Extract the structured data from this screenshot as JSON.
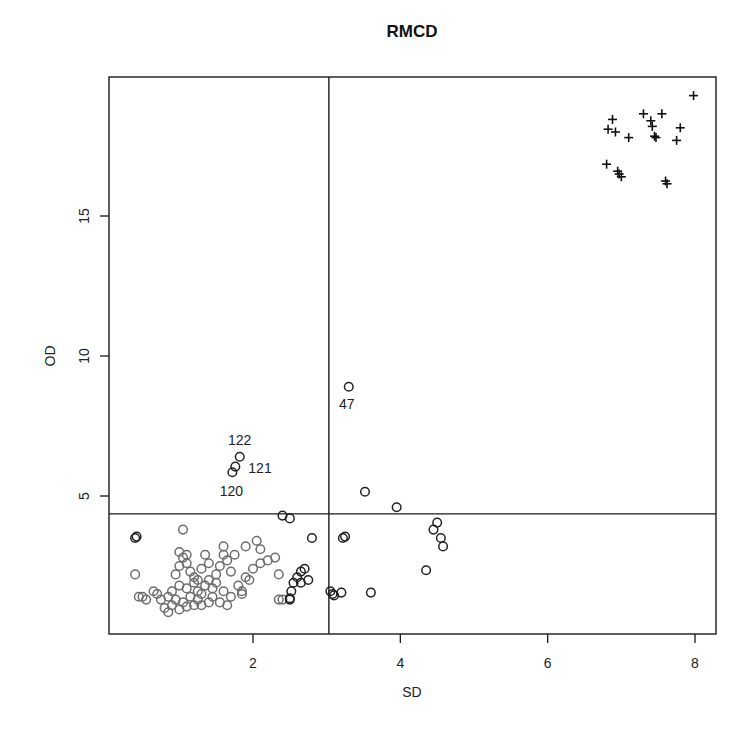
{
  "chart_data": {
    "type": "scatter",
    "title": "RMCD",
    "xlabel": "SD",
    "ylabel": "OD",
    "xlim": [
      0.2,
      8.3
    ],
    "ylim": [
      0.0,
      19.9
    ],
    "x_ticks": [
      2,
      4,
      6,
      8
    ],
    "y_ticks": [
      5,
      10,
      15
    ],
    "grid": false,
    "legend": null,
    "cutoffs": {
      "sd": 3.03,
      "od": 4.36
    },
    "series": [
      {
        "name": "regular (gray circles)",
        "marker": "circle",
        "color": "#6e6e6e",
        "points": [
          [
            0.8,
            1.0
          ],
          [
            0.85,
            0.85
          ],
          [
            0.9,
            1.1
          ],
          [
            0.95,
            1.3
          ],
          [
            1.0,
            0.95
          ],
          [
            1.05,
            1.2
          ],
          [
            1.1,
            1.05
          ],
          [
            1.15,
            1.4
          ],
          [
            1.2,
            1.1
          ],
          [
            1.25,
            1.6
          ],
          [
            0.7,
            1.5
          ],
          [
            0.75,
            1.3
          ],
          [
            0.9,
            1.6
          ],
          [
            1.0,
            1.8
          ],
          [
            1.1,
            1.7
          ],
          [
            1.2,
            1.9
          ],
          [
            1.3,
            1.5
          ],
          [
            1.35,
            1.8
          ],
          [
            1.4,
            2.0
          ],
          [
            1.45,
            1.7
          ],
          [
            0.95,
            2.2
          ],
          [
            1.0,
            2.5
          ],
          [
            1.05,
            2.8
          ],
          [
            1.1,
            2.6
          ],
          [
            1.15,
            2.3
          ],
          [
            1.2,
            2.1
          ],
          [
            1.3,
            2.4
          ],
          [
            1.4,
            2.6
          ],
          [
            1.5,
            2.2
          ],
          [
            1.55,
            2.5
          ],
          [
            1.6,
            2.9
          ],
          [
            1.65,
            2.7
          ],
          [
            1.7,
            2.3
          ],
          [
            1.5,
            1.9
          ],
          [
            1.6,
            1.6
          ],
          [
            1.7,
            1.4
          ],
          [
            1.55,
            1.2
          ],
          [
            1.65,
            1.1
          ],
          [
            1.8,
            1.8
          ],
          [
            1.85,
            1.6
          ],
          [
            1.9,
            2.1
          ],
          [
            2.0,
            2.4
          ],
          [
            2.1,
            2.6
          ],
          [
            2.2,
            2.7
          ],
          [
            2.3,
            2.8
          ],
          [
            1.6,
            3.2
          ],
          [
            1.75,
            2.9
          ],
          [
            1.35,
            2.9
          ],
          [
            1.0,
            3.0
          ],
          [
            1.1,
            2.9
          ],
          [
            0.4,
            2.2
          ],
          [
            0.5,
            1.4
          ],
          [
            0.55,
            1.3
          ],
          [
            0.45,
            1.4
          ],
          [
            1.3,
            1.1
          ],
          [
            1.4,
            1.2
          ],
          [
            1.45,
            1.4
          ],
          [
            1.25,
            1.3
          ],
          [
            2.35,
            2.2
          ],
          [
            2.35,
            1.3
          ],
          [
            2.05,
            3.4
          ],
          [
            2.1,
            3.1
          ],
          [
            1.9,
            3.2
          ],
          [
            1.05,
            3.8
          ],
          [
            1.25,
            2.0
          ],
          [
            0.85,
            1.4
          ],
          [
            0.65,
            1.6
          ],
          [
            1.85,
            1.5
          ],
          [
            1.95,
            2.0
          ],
          [
            2.4,
            1.3
          ]
        ]
      },
      {
        "name": "regular (black circles)",
        "marker": "circle",
        "color": "#222222",
        "points": [
          [
            0.4,
            3.5
          ],
          [
            0.42,
            3.55
          ],
          [
            2.4,
            4.3
          ],
          [
            2.5,
            4.2
          ],
          [
            2.8,
            3.5
          ],
          [
            2.5,
            1.3
          ],
          [
            2.5,
            1.35
          ],
          [
            2.52,
            1.6
          ],
          [
            2.55,
            1.9
          ],
          [
            2.6,
            2.1
          ],
          [
            2.65,
            2.3
          ],
          [
            2.7,
            2.4
          ],
          [
            2.75,
            2.0
          ],
          [
            2.65,
            1.9
          ],
          [
            3.05,
            1.6
          ],
          [
            3.08,
            1.5
          ],
          [
            3.1,
            1.45
          ],
          [
            3.2,
            1.55
          ],
          [
            3.22,
            3.5
          ],
          [
            3.25,
            3.55
          ],
          [
            3.6,
            1.55
          ],
          [
            4.35,
            2.35
          ],
          [
            4.45,
            3.8
          ],
          [
            4.5,
            4.05
          ],
          [
            4.55,
            3.5
          ],
          [
            4.58,
            3.2
          ],
          [
            3.52,
            5.15
          ],
          [
            3.95,
            4.6
          ]
        ]
      },
      {
        "name": "labeled observations",
        "marker": "circle",
        "color": "#222222",
        "points": [
          {
            "x": 3.3,
            "y": 8.9,
            "label": "47"
          },
          {
            "x": 1.82,
            "y": 6.4,
            "label": "122"
          },
          {
            "x": 1.76,
            "y": 6.05,
            "label": "121"
          },
          {
            "x": 1.72,
            "y": 5.85,
            "label": "120"
          }
        ]
      },
      {
        "name": "outliers (plus)",
        "marker": "plus",
        "color": "#111111",
        "points": [
          [
            6.8,
            16.85
          ],
          [
            6.95,
            16.6
          ],
          [
            6.97,
            16.5
          ],
          [
            7.0,
            16.4
          ],
          [
            7.6,
            16.25
          ],
          [
            7.62,
            16.15
          ],
          [
            6.82,
            18.1
          ],
          [
            6.88,
            18.45
          ],
          [
            6.92,
            18.0
          ],
          [
            7.1,
            17.8
          ],
          [
            7.3,
            18.65
          ],
          [
            7.4,
            18.4
          ],
          [
            7.42,
            18.2
          ],
          [
            7.45,
            17.85
          ],
          [
            7.47,
            17.8
          ],
          [
            7.55,
            18.65
          ],
          [
            7.75,
            17.7
          ],
          [
            7.8,
            18.15
          ],
          [
            7.98,
            19.3
          ]
        ]
      }
    ]
  }
}
